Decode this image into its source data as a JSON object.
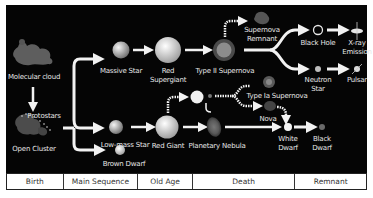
{
  "objects": {
    "molecular_cloud": "Molecular cloud",
    "protostars": "Protostars",
    "open_cluster": "Open Cluster",
    "massive_star": "Massive Star",
    "red_supergiant_1": "Red",
    "red_supergiant_2": "Supergiant",
    "type2_supernova": "Type II Supernova",
    "supernova_remnant_1": "Supernova",
    "supernova_remnant_2": "Remnant",
    "black_hole": "Black Hole",
    "xray_1": "X-ray",
    "xray_2": "Emission",
    "neutron_star_1": "Neutron",
    "neutron_star_2": "Star",
    "pulsar": "Pulsar",
    "low_mass_star": "Low-mass Star",
    "brown_dwarf": "Brown Dwarf",
    "red_giant": "Red Giant",
    "type1a_supernova": "Type Ia Supernova",
    "nova": "Nova",
    "planetary_nebula": "Planetary Nebula",
    "white_dwarf_1": "White",
    "white_dwarf_2": "Dwarf",
    "black_dwarf_1": "Black",
    "black_dwarf_2": "Dwarf"
  },
  "stages": [
    {
      "label": "Birth"
    },
    {
      "label": "Main Sequence"
    },
    {
      "label": "Old Age"
    },
    {
      "label": "Death"
    },
    {
      "label": "Remnant"
    }
  ],
  "colors": {
    "background": "#050505",
    "arrow": "#f2f2f2",
    "text": "#e6e6e6"
  }
}
